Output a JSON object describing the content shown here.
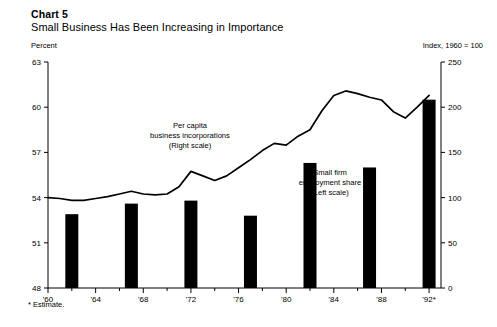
{
  "header": {
    "chart_number": "Chart 5",
    "title": "Small Business Has Been Increasing in Importance",
    "left_axis_unit": "Percent",
    "right_axis_unit": "Index, 1960 = 100"
  },
  "footnote": "* Estimate.",
  "annotations": {
    "line_label": {
      "line1": "Per capita",
      "line2": "business incorporations",
      "line3": "(Right scale)"
    },
    "bar_label": {
      "line1": "Small firm",
      "line2": "employment share",
      "line3": "(Left scale)"
    }
  },
  "chart_data": {
    "type": "bar",
    "title": "Small Business Has Been Increasing in Importance",
    "subtitle": "Chart 5",
    "xlabel": "",
    "ylabel": "Percent",
    "y2label": "Index, 1960 = 100",
    "xlim": [
      1960,
      1993
    ],
    "ylim": [
      48,
      63
    ],
    "y2lim": [
      0,
      250
    ],
    "yticks": [
      48,
      51,
      54,
      57,
      60,
      63
    ],
    "y2ticks": [
      0,
      50,
      100,
      150,
      200,
      250
    ],
    "xticks": [
      1960,
      1962,
      1964,
      1966,
      1968,
      1970,
      1972,
      1974,
      1976,
      1978,
      1980,
      1982,
      1984,
      1986,
      1988,
      1990,
      1992
    ],
    "xticklabels": [
      "'60",
      "",
      "'64",
      "",
      "'68",
      "",
      "'72",
      "",
      "'76",
      "",
      "'80",
      "",
      "'84",
      "",
      "'88",
      "",
      "'92*"
    ],
    "grid": false,
    "legend": "annotations",
    "series": [
      {
        "name": "Small firm employment share (Left scale)",
        "type": "bar",
        "axis": "left",
        "units": "percent",
        "x": [
          1962,
          1967,
          1972,
          1977,
          1982,
          1987,
          1992
        ],
        "values": [
          52.9,
          53.6,
          53.8,
          52.8,
          56.3,
          56.0,
          60.5
        ]
      },
      {
        "name": "Per capita business incorporations (Right scale)",
        "type": "line",
        "axis": "right",
        "units": "index, 1960 = 100",
        "x": [
          1960,
          1961,
          1962,
          1963,
          1964,
          1965,
          1966,
          1967,
          1968,
          1969,
          1970,
          1971,
          1972,
          1973,
          1974,
          1975,
          1976,
          1977,
          1978,
          1979,
          1980,
          1981,
          1982,
          1983,
          1984,
          1985,
          1986,
          1987,
          1988,
          1989,
          1990,
          1991,
          1992
        ],
        "values": [
          100,
          99,
          97,
          97,
          99,
          101,
          104,
          107,
          104,
          103,
          104,
          112,
          129,
          124,
          119,
          124,
          133,
          142,
          152,
          160,
          158,
          168,
          175,
          196,
          213,
          218,
          215,
          211,
          208,
          195,
          188,
          200,
          213
        ]
      }
    ]
  },
  "geometry": {
    "plot": {
      "x": 48,
      "y": 62,
      "w": 393,
      "h": 226
    }
  }
}
